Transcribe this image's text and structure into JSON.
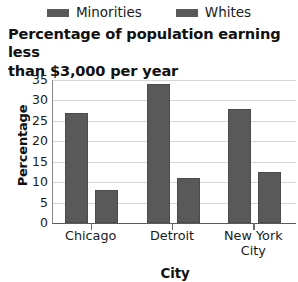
{
  "chart_data": {
    "type": "bar",
    "title": "Percentage of population earning less than $3,000 per year",
    "title_line1": "Percentage of population earning less",
    "title_line2": "than $3,000 per year",
    "xlabel": "City",
    "ylabel": "Percentage",
    "categories": [
      "Chicago",
      "Detroit",
      "New York City"
    ],
    "category_lines": [
      [
        "Chicago"
      ],
      [
        "Detroit"
      ],
      [
        "New York",
        "City"
      ]
    ],
    "series": [
      {
        "name": "Minorities",
        "color": "#59595a",
        "values": [
          27,
          34,
          28
        ]
      },
      {
        "name": "Whites",
        "color": "#59595a",
        "values": [
          8,
          11,
          12.5
        ]
      }
    ],
    "ylim": [
      0,
      35
    ],
    "yticks": [
      0,
      5,
      10,
      15,
      20,
      25,
      30,
      35
    ],
    "ytick_labels": [
      "0",
      "5",
      "10",
      "15",
      "20",
      "25",
      "30",
      "35"
    ],
    "grid": true,
    "legend_position": "top"
  }
}
